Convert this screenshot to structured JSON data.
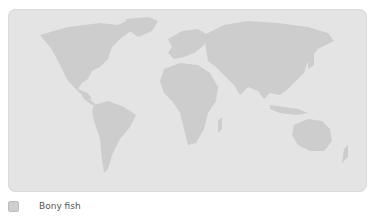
{
  "map": {
    "projection": "world",
    "ocean_color": "#e4e4e4",
    "land_color": "#cdcdcd"
  },
  "legend": {
    "items": [
      {
        "label": "Bony fish",
        "color": "#cfcfcf"
      }
    ]
  }
}
